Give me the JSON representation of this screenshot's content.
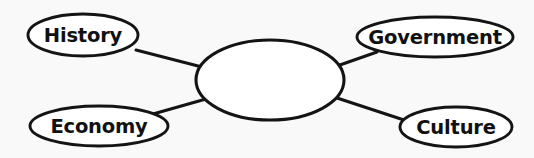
{
  "diagram": {
    "type": "concept-map-spider-diagram",
    "title": "",
    "background_color": "#f9f9f9",
    "stroke_color": "#141414",
    "node_fill_color": "#ffffff",
    "text_color": "#111111",
    "center_node": {
      "label": "",
      "name": "center-node",
      "cx": 270,
      "cy": 80,
      "rx": 74,
      "ry": 40,
      "empty": true
    },
    "nodes": [
      {
        "label": "History",
        "name": "node-history",
        "cx": 83,
        "cy": 35,
        "rx": 55,
        "ry": 21,
        "position": "top-left"
      },
      {
        "label": "Government",
        "name": "node-government",
        "cx": 435,
        "cy": 37,
        "rx": 78,
        "ry": 20,
        "position": "top-right"
      },
      {
        "label": "Economy",
        "name": "node-economy",
        "cx": 99,
        "cy": 126,
        "rx": 69,
        "ry": 20,
        "position": "bottom-left"
      },
      {
        "label": "Culture",
        "name": "node-culture",
        "cx": 456,
        "cy": 127,
        "rx": 56,
        "ry": 20,
        "position": "bottom-right"
      }
    ],
    "connectors": [
      {
        "name": "connector-history",
        "from": "node-history",
        "to": "center-node",
        "x1": 136,
        "y1": 50,
        "x2": 202,
        "y2": 67
      },
      {
        "name": "connector-government",
        "from": "center-node",
        "to": "node-government",
        "x1": 337,
        "y1": 66,
        "x2": 377,
        "y2": 52
      },
      {
        "name": "connector-economy",
        "from": "node-economy",
        "to": "center-node",
        "x1": 153,
        "y1": 114,
        "x2": 206,
        "y2": 99
      },
      {
        "name": "connector-culture",
        "from": "center-node",
        "to": "node-culture",
        "x1": 337,
        "y1": 98,
        "x2": 404,
        "y2": 120
      }
    ]
  }
}
